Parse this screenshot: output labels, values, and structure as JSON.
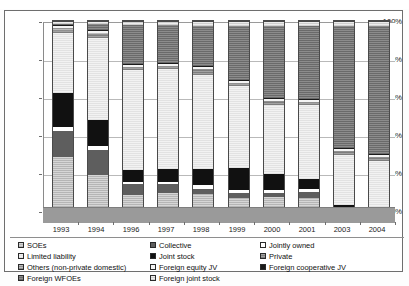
{
  "chart_data": {
    "type": "bar",
    "subtype": "stacked-100-percent",
    "title": "",
    "xlabel": "",
    "ylabel": "",
    "ylim": [
      0,
      100
    ],
    "ytick_labels": [
      "0%",
      "20%",
      "40%",
      "60%",
      "80%",
      "100%"
    ],
    "ytick_values": [
      0,
      20,
      40,
      60,
      80,
      100
    ],
    "grid": true,
    "legend_position": "bottom",
    "categories": [
      "1993",
      "1994",
      "1996",
      "1997",
      "1998",
      "1999",
      "2000",
      "2001",
      "2003",
      "2004"
    ],
    "series": [
      {
        "name": "SOEs",
        "fill": "hatch-light-gray",
        "color": "#c9c9c9",
        "values": [
          32,
          23,
          13,
          14,
          13.5,
          11.5,
          12,
          11.5,
          1.5,
          1
        ]
      },
      {
        "name": "Collective",
        "fill": "dark-gray",
        "color": "#5e5e5e",
        "values": [
          13,
          12.5,
          5.5,
          4.5,
          2.5,
          2.5,
          2,
          3,
          0.5,
          0.5
        ]
      },
      {
        "name": "Jointly owned",
        "fill": "white",
        "color": "#ffffff",
        "values": [
          2,
          2,
          1,
          1,
          2,
          1.5,
          1.5,
          1.5,
          0.5,
          0.5
        ]
      },
      {
        "name": "Joint stock",
        "fill": "black",
        "color": "#111111",
        "values": [
          17,
          13,
          6,
          6.5,
          8,
          11,
          8,
          5,
          5.5,
          4
        ]
      },
      {
        "name": "Limited liability",
        "fill": "very-light-gray",
        "color": "#e9e9e9",
        "values": [
          30,
          41,
          50,
          50,
          47,
          41,
          34.5,
          37,
          25,
          24
        ]
      },
      {
        "name": "Private",
        "fill": "mid-gray-hatch",
        "color": "#8f8f8f",
        "values": [
          1,
          1.5,
          1,
          1,
          2.5,
          1,
          1.5,
          1,
          1.5,
          1.5
        ]
      },
      {
        "name": "Others (non-private domestic)",
        "fill": "gray-hatch",
        "color": "#a8a8a8",
        "values": [
          1.5,
          1,
          0.5,
          0.5,
          0.5,
          0.5,
          0.5,
          0.5,
          0.5,
          0.5
        ]
      },
      {
        "name": "Foreign equity JV",
        "fill": "off-white",
        "color": "#f4f4f4",
        "values": [
          1,
          1,
          1,
          1,
          1,
          1,
          1,
          1,
          1,
          1
        ]
      },
      {
        "name": "Foreign cooperative JV",
        "fill": "black",
        "color": "#1a1a1a",
        "values": [
          0.5,
          0.5,
          0.5,
          0.5,
          0.5,
          0.5,
          0.5,
          0.5,
          0.5,
          0.5
        ]
      },
      {
        "name": "Foreign WFOEs",
        "fill": "dark-gray-hatch",
        "color": "#7a7a7a",
        "values": [
          0.5,
          3,
          19.5,
          19,
          20,
          27,
          36,
          36.5,
          61,
          64
        ]
      },
      {
        "name": "Foreign joint stock",
        "fill": "light-gray-hatch",
        "color": "#dcdcdc",
        "values": [
          1.5,
          1.5,
          2,
          2,
          2.5,
          2.5,
          2.5,
          2.5,
          2.5,
          2.5
        ]
      }
    ]
  },
  "axes": {
    "y_ticks": [
      {
        "label": "100%",
        "value": 100
      },
      {
        "label": "80%",
        "value": 80
      },
      {
        "label": "60%",
        "value": 60
      },
      {
        "label": "40%",
        "value": 40
      },
      {
        "label": "20%",
        "value": 20
      },
      {
        "label": "0%",
        "value": 0
      }
    ],
    "x_ticks": [
      "1993",
      "1994",
      "1996",
      "1997",
      "1998",
      "1999",
      "2000",
      "2001",
      "2003",
      "2004"
    ]
  },
  "legend": {
    "columns": [
      {
        "items": [
          {
            "label": "SOEs",
            "swatch": "#c9c9c9"
          },
          {
            "label": "Limited liability",
            "swatch": "#e9e9e9"
          },
          {
            "label": "Others (non-private domestic)",
            "swatch": "#a8a8a8"
          },
          {
            "label": "Foreign WFOEs",
            "swatch": "#7a7a7a"
          }
        ]
      },
      {
        "items": [
          {
            "label": "Collective",
            "swatch": "#5e5e5e"
          },
          {
            "label": "Joint stock",
            "swatch": "#111111"
          },
          {
            "label": "Foreign equity JV",
            "swatch": "#f4f4f4"
          },
          {
            "label": "Foreign joint stock",
            "swatch": "#dcdcdc"
          }
        ]
      },
      {
        "items": [
          {
            "label": "Jointly owned",
            "swatch": "#ffffff"
          },
          {
            "label": "Private",
            "swatch": "#8f8f8f"
          },
          {
            "label": "Foreign cooperative JV",
            "swatch": "#1a1a1a"
          }
        ]
      }
    ]
  }
}
